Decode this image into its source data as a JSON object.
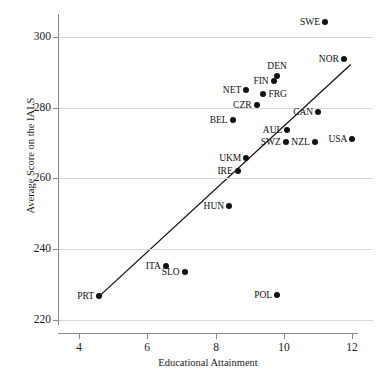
{
  "chart_data": {
    "type": "scatter",
    "title": "",
    "xlabel": "Educational Attainment",
    "ylabel": "Average Score on the IALS",
    "xlim": [
      3.4,
      12.6
    ],
    "ylim": [
      218.5,
      306.5
    ],
    "xticks": [
      4,
      6,
      8,
      10,
      12
    ],
    "yticks": [
      220,
      240,
      260,
      280,
      300
    ],
    "grid": "horizontal",
    "legend": "none",
    "points": [
      {
        "label": "SWE",
        "x": 11.2,
        "y": 304.2,
        "label_pos": "left"
      },
      {
        "label": "NOR",
        "x": 11.75,
        "y": 293.7,
        "label_pos": "left"
      },
      {
        "label": "DEN",
        "x": 9.8,
        "y": 289.0,
        "label_pos": "above"
      },
      {
        "label": "FIN",
        "x": 9.7,
        "y": 287.6,
        "label_pos": "left"
      },
      {
        "label": "NET",
        "x": 8.9,
        "y": 285.0,
        "label_pos": "left"
      },
      {
        "label": "FRG",
        "x": 9.4,
        "y": 284.0,
        "label_pos": "right"
      },
      {
        "label": "CZR",
        "x": 9.2,
        "y": 280.8,
        "label_pos": "left"
      },
      {
        "label": "CAN",
        "x": 11.0,
        "y": 278.8,
        "label_pos": "left"
      },
      {
        "label": "BEL",
        "x": 8.5,
        "y": 276.6,
        "label_pos": "left"
      },
      {
        "label": "AUL",
        "x": 10.1,
        "y": 273.7,
        "label_pos": "left"
      },
      {
        "label": "SWZ",
        "x": 10.05,
        "y": 270.3,
        "label_pos": "left"
      },
      {
        "label": "NZL",
        "x": 10.9,
        "y": 270.3,
        "label_pos": "left"
      },
      {
        "label": "USA",
        "x": 12.0,
        "y": 271.2,
        "label_pos": "left"
      },
      {
        "label": "UKM",
        "x": 8.9,
        "y": 265.8,
        "label_pos": "left"
      },
      {
        "label": "IRE",
        "x": 8.65,
        "y": 262.0,
        "label_pos": "left"
      },
      {
        "label": "HUN",
        "x": 8.4,
        "y": 252.3,
        "label_pos": "left"
      },
      {
        "label": "ITA",
        "x": 6.55,
        "y": 235.3,
        "label_pos": "left"
      },
      {
        "label": "SLO",
        "x": 7.1,
        "y": 233.6,
        "label_pos": "left"
      },
      {
        "label": "PRT",
        "x": 4.6,
        "y": 226.6,
        "label_pos": "left"
      },
      {
        "label": "POL",
        "x": 9.8,
        "y": 227.1,
        "label_pos": "left"
      }
    ],
    "fit_line": {
      "name": "linear-regression-line",
      "x1": 4.6,
      "y1": 226.6,
      "x2": 11.95,
      "y2": 292.2,
      "color": "#111111"
    },
    "colors": {
      "point": "#101010",
      "gridline": "#d9d9d9",
      "axis": "#8a8a8a",
      "text": "#1a1a1a"
    }
  }
}
